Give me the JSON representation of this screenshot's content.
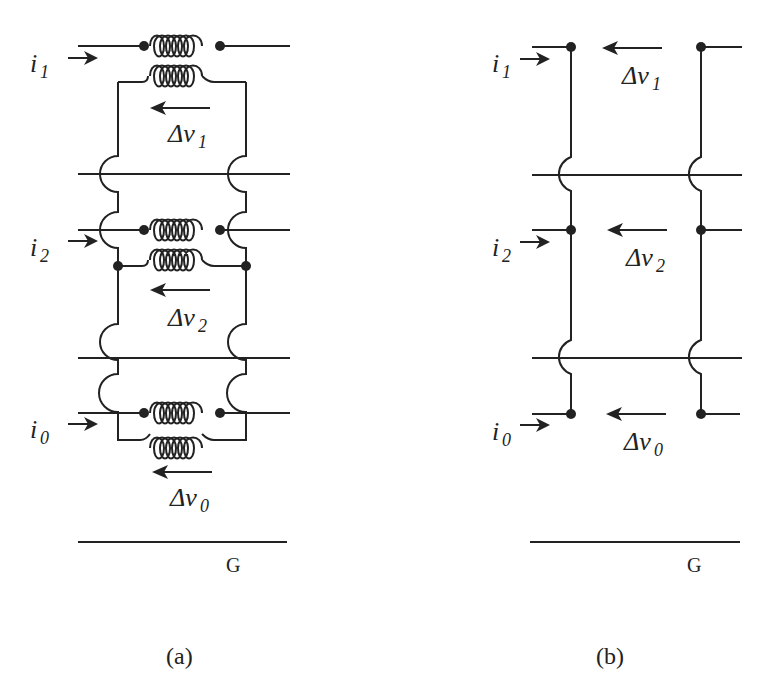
{
  "figure": {
    "panel_a": {
      "caption": "(a)",
      "ground_label": "G",
      "phases": [
        {
          "current": "i",
          "current_sub": "1",
          "voltage": "Δv",
          "voltage_sub": "1"
        },
        {
          "current": "i",
          "current_sub": "2",
          "voltage": "Δv",
          "voltage_sub": "2"
        },
        {
          "current": "i",
          "current_sub": "0",
          "voltage": "Δv",
          "voltage_sub": "0"
        }
      ]
    },
    "panel_b": {
      "caption": "(b)",
      "ground_label": "G",
      "phases": [
        {
          "current": "i",
          "current_sub": "1",
          "voltage": "Δv",
          "voltage_sub": "1"
        },
        {
          "current": "i",
          "current_sub": "2",
          "voltage": "Δv",
          "voltage_sub": "2"
        },
        {
          "current": "i",
          "current_sub": "0",
          "voltage": "Δv",
          "voltage_sub": "0"
        }
      ]
    }
  }
}
